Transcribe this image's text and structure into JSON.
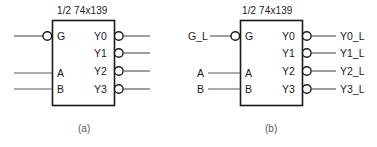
{
  "page": {
    "background": "#ffffff",
    "ink": "#1a1a1a",
    "caption_color": "#555555",
    "width": 377,
    "height": 147
  },
  "figures": [
    {
      "id": "a",
      "caption": "(a)",
      "chip_title": "1/2 74x139",
      "inputs": [
        {
          "pin": "G",
          "inverted": true,
          "net": ""
        },
        {
          "pin": "A",
          "inverted": false,
          "net": ""
        },
        {
          "pin": "B",
          "inverted": false,
          "net": ""
        }
      ],
      "outputs": [
        {
          "pin": "Y0",
          "inverted": true,
          "net": ""
        },
        {
          "pin": "Y1",
          "inverted": true,
          "net": ""
        },
        {
          "pin": "Y2",
          "inverted": true,
          "net": ""
        },
        {
          "pin": "Y3",
          "inverted": true,
          "net": ""
        }
      ]
    },
    {
      "id": "b",
      "caption": "(b)",
      "chip_title": "1/2 74x139",
      "inputs": [
        {
          "pin": "G",
          "inverted": true,
          "net": "G_L"
        },
        {
          "pin": "A",
          "inverted": false,
          "net": "A"
        },
        {
          "pin": "B",
          "inverted": false,
          "net": "B"
        }
      ],
      "outputs": [
        {
          "pin": "Y0",
          "inverted": true,
          "net": "Y0_L"
        },
        {
          "pin": "Y1",
          "inverted": true,
          "net": "Y1_L"
        },
        {
          "pin": "Y2",
          "inverted": true,
          "net": "Y2_L"
        },
        {
          "pin": "Y3",
          "inverted": true,
          "net": "Y3_L"
        }
      ]
    }
  ]
}
